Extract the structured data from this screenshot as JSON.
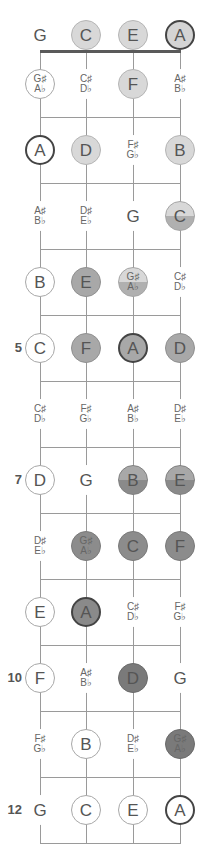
{
  "diagram": {
    "type": "ukulele-fretboard-note-map",
    "strings": [
      "G",
      "C",
      "E",
      "A"
    ],
    "frets_shown": 12,
    "fret_markers": [
      {
        "fret": 5,
        "label": "5"
      },
      {
        "fret": 7,
        "label": "7"
      },
      {
        "fret": 10,
        "label": "10"
      },
      {
        "fret": 12,
        "label": "12"
      }
    ],
    "rows": [
      {
        "fret": 0,
        "notes": [
          {
            "top": "G",
            "bottom": "",
            "style": "plain"
          },
          {
            "top": "C",
            "bottom": "",
            "style": "l1"
          },
          {
            "top": "E",
            "bottom": "",
            "style": "l1"
          },
          {
            "top": "A",
            "bottom": "",
            "style": "l1-root"
          }
        ]
      },
      {
        "fret": 1,
        "notes": [
          {
            "top": "G♯",
            "bottom": "A♭",
            "style": "open-ring"
          },
          {
            "top": "C♯",
            "bottom": "D♭",
            "style": "plain"
          },
          {
            "top": "F",
            "bottom": "",
            "style": "l1"
          },
          {
            "top": "A♯",
            "bottom": "B♭",
            "style": "plain"
          }
        ]
      },
      {
        "fret": 2,
        "notes": [
          {
            "top": "A",
            "bottom": "",
            "style": "root-ring"
          },
          {
            "top": "D",
            "bottom": "",
            "style": "l1"
          },
          {
            "top": "F♯",
            "bottom": "G♭",
            "style": "plain"
          },
          {
            "top": "B",
            "bottom": "",
            "style": "l1"
          }
        ]
      },
      {
        "fret": 3,
        "notes": [
          {
            "top": "A♯",
            "bottom": "B♭",
            "style": "plain"
          },
          {
            "top": "D♯",
            "bottom": "E♭",
            "style": "plain"
          },
          {
            "top": "G",
            "bottom": "",
            "style": "plain"
          },
          {
            "top": "C",
            "bottom": "",
            "style": "l2"
          }
        ]
      },
      {
        "fret": 4,
        "notes": [
          {
            "top": "B",
            "bottom": "",
            "style": "open-ring"
          },
          {
            "top": "E",
            "bottom": "",
            "style": "l3"
          },
          {
            "top": "G♯",
            "bottom": "A♭",
            "style": "l2"
          },
          {
            "top": "C♯",
            "bottom": "D♭",
            "style": "plain"
          }
        ]
      },
      {
        "fret": 5,
        "notes": [
          {
            "top": "C",
            "bottom": "",
            "style": "open-ring"
          },
          {
            "top": "F",
            "bottom": "",
            "style": "l3"
          },
          {
            "top": "A",
            "bottom": "",
            "style": "l3-root"
          },
          {
            "top": "D",
            "bottom": "",
            "style": "l3"
          }
        ]
      },
      {
        "fret": 6,
        "notes": [
          {
            "top": "C♯",
            "bottom": "D♭",
            "style": "plain"
          },
          {
            "top": "F♯",
            "bottom": "G♭",
            "style": "plain"
          },
          {
            "top": "A♯",
            "bottom": "B♭",
            "style": "plain"
          },
          {
            "top": "D♯",
            "bottom": "E♭",
            "style": "plain"
          }
        ]
      },
      {
        "fret": 7,
        "notes": [
          {
            "top": "D",
            "bottom": "",
            "style": "open-ring"
          },
          {
            "top": "G",
            "bottom": "",
            "style": "plain"
          },
          {
            "top": "B",
            "bottom": "",
            "style": "l4"
          },
          {
            "top": "E",
            "bottom": "",
            "style": "l4"
          }
        ]
      },
      {
        "fret": 8,
        "notes": [
          {
            "top": "D♯",
            "bottom": "E♭",
            "style": "plain"
          },
          {
            "top": "G♯",
            "bottom": "A♭",
            "style": "l5"
          },
          {
            "top": "C",
            "bottom": "",
            "style": "l5"
          },
          {
            "top": "F",
            "bottom": "",
            "style": "l5"
          }
        ]
      },
      {
        "fret": 9,
        "notes": [
          {
            "top": "E",
            "bottom": "",
            "style": "open-ring"
          },
          {
            "top": "A",
            "bottom": "",
            "style": "l5-root"
          },
          {
            "top": "C♯",
            "bottom": "D♭",
            "style": "plain"
          },
          {
            "top": "F♯",
            "bottom": "G♭",
            "style": "plain"
          }
        ]
      },
      {
        "fret": 10,
        "notes": [
          {
            "top": "F",
            "bottom": "",
            "style": "open-ring"
          },
          {
            "top": "A♯",
            "bottom": "B♭",
            "style": "plain"
          },
          {
            "top": "D",
            "bottom": "",
            "style": "l6"
          },
          {
            "top": "G",
            "bottom": "",
            "style": "plain"
          }
        ]
      },
      {
        "fret": 11,
        "notes": [
          {
            "top": "F♯",
            "bottom": "G♭",
            "style": "plain"
          },
          {
            "top": "B",
            "bottom": "",
            "style": "open-ring"
          },
          {
            "top": "D♯",
            "bottom": "E♭",
            "style": "plain"
          },
          {
            "top": "G♯",
            "bottom": "A♭",
            "style": "l6"
          }
        ]
      },
      {
        "fret": 12,
        "notes": [
          {
            "top": "G",
            "bottom": "",
            "style": "plain"
          },
          {
            "top": "C",
            "bottom": "",
            "style": "open-ring"
          },
          {
            "top": "E",
            "bottom": "",
            "style": "open-ring"
          },
          {
            "top": "A",
            "bottom": "",
            "style": "root-ring"
          }
        ]
      }
    ],
    "colors": {
      "string_line": "#9a9a9a",
      "nut": "#5a5a5a",
      "text": "#555555",
      "shade_light": "#d8d8d8",
      "shade_mid": "#a8a8a8",
      "shade_dark": "#8c8c8c",
      "shade_darkest": "#7a7a7a",
      "root_ring": "#444444"
    }
  }
}
